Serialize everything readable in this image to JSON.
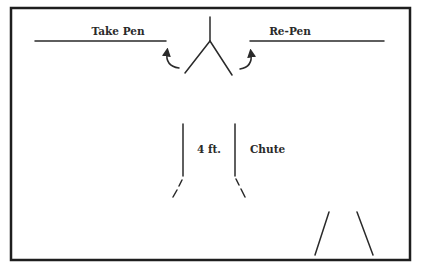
{
  "diagram": {
    "labels": {
      "take_pen": "Take Pen",
      "re_pen": "Re-Pen",
      "chute_width": "4 ft.",
      "chute": "Chute"
    },
    "colors": {
      "line": "#2a2a2a",
      "background": "#ffffff"
    }
  }
}
